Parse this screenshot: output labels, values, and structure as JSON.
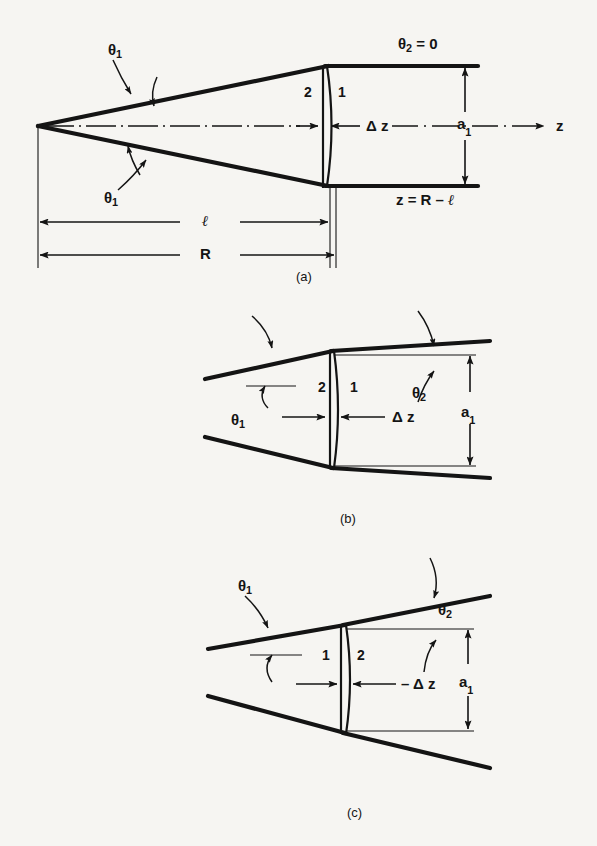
{
  "figure": {
    "background_color": "#f6f5f2",
    "ink_color": "#141414",
    "panels": [
      {
        "id": "a",
        "caption": "(a)",
        "description": "Cone resonator with flat output mirror, theta2 = 0",
        "labels": {
          "theta1_top": "θ",
          "theta1_top_sub": "1",
          "theta1_bottom": "θ",
          "theta1_bottom_sub": "1",
          "theta2_eq_zero": "θ",
          "theta2_eq_zero_sub": "2",
          "theta2_eq_zero_rest": " = 0",
          "region_2": "2",
          "region_1": "1",
          "delta_z": "Δ z",
          "a1": "a",
          "a1_sub": "1",
          "z_axis": "z",
          "z_equation": "z = R – ",
          "z_equation_ell": "ℓ",
          "dim_l": "ℓ",
          "dim_R": "R"
        }
      },
      {
        "id": "b",
        "caption": "(b)",
        "description": "Diverging beam, positive delta z, theta2 greater than zero",
        "labels": {
          "theta1": "θ",
          "theta1_sub": "1",
          "theta2": "θ",
          "theta2_sub": "2",
          "region_2": "2",
          "region_1": "1",
          "delta_z": "Δ z",
          "a1": "a",
          "a1_sub": "1"
        }
      },
      {
        "id": "c",
        "caption": "(c)",
        "description": "Diverging beam, negative delta z, steeper theta2",
        "labels": {
          "theta1": "θ",
          "theta1_sub": "1",
          "theta2": "θ",
          "theta2_sub": "2",
          "region_1": "1",
          "region_2": "2",
          "minus_delta_z": "– Δ z",
          "a1": "a",
          "a1_sub": "1"
        }
      }
    ]
  }
}
